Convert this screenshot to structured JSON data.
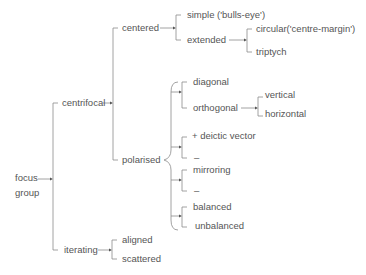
{
  "diagram": {
    "type": "tree",
    "root": {
      "label_line1": "focus",
      "label_line2": "group"
    },
    "nodes": {
      "centrifocal": "centrifocal",
      "centered": "centered",
      "simple": "simple ('bulls-eye')",
      "extended": "extended",
      "circular": "circular('centre-margin')",
      "triptych": "triptych",
      "polarised": "polarised",
      "diagonal": "diagonal",
      "orthogonal": "orthogonal",
      "vertical": "vertical",
      "horizontal": "horizontal",
      "deictic": "+ deictic vector",
      "dash1": "–",
      "mirroring": "mirroring",
      "dash2": "–",
      "balanced": "balanced",
      "unbalanced": "unbalanced",
      "iterating": "iterating",
      "aligned": "aligned",
      "scattered": "scattered"
    },
    "colors": {
      "text": "#555555",
      "lines": "#8a8a8a"
    }
  }
}
